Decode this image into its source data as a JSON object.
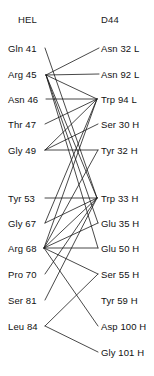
{
  "diagram": {
    "type": "bipartite-contact-map",
    "line_color": "#1b1b1b",
    "background_color": "#ffffff",
    "text_color": "#111111"
  },
  "columns": {
    "left": {
      "header": "HEL",
      "header_x": 18,
      "header_y": 14
    },
    "right": {
      "header": "D44",
      "header_x": 101,
      "header_y": 14
    }
  },
  "left_nodes": [
    {
      "id": "L0",
      "label": "Gln 41",
      "residue": "Gln",
      "number": 41,
      "x": 8,
      "y": 48,
      "anchor_x": 45,
      "anchor_y": 48
    },
    {
      "id": "L1",
      "label": "Arg 45",
      "residue": "Arg",
      "number": 45,
      "x": 8,
      "y": 74,
      "anchor_x": 46,
      "anchor_y": 75
    },
    {
      "id": "L2",
      "label": "Asn 46",
      "residue": "Asn",
      "number": 46,
      "x": 8,
      "y": 99,
      "anchor_x": 46,
      "anchor_y": 99
    },
    {
      "id": "L3",
      "label": "Thr 47",
      "residue": "Thr",
      "number": 47,
      "x": 8,
      "y": 124,
      "anchor_x": 45,
      "anchor_y": 124
    },
    {
      "id": "L4",
      "label": "Gly 49",
      "residue": "Gly",
      "number": 49,
      "x": 8,
      "y": 150,
      "anchor_x": 45,
      "anchor_y": 150
    },
    {
      "id": "L5",
      "label": "Tyr 53",
      "residue": "Tyr",
      "number": 53,
      "x": 8,
      "y": 198,
      "anchor_x": 45,
      "anchor_y": 198
    },
    {
      "id": "L6",
      "label": "Gly 67",
      "residue": "Gly",
      "number": 67,
      "x": 8,
      "y": 223,
      "anchor_x": 45,
      "anchor_y": 223
    },
    {
      "id": "L7",
      "label": "Arg 68",
      "residue": "Arg",
      "number": 68,
      "x": 8,
      "y": 248,
      "anchor_x": 44,
      "anchor_y": 248
    },
    {
      "id": "L8",
      "label": "Pro 70",
      "residue": "Pro",
      "number": 70,
      "x": 8,
      "y": 274,
      "anchor_x": 45,
      "anchor_y": 274
    },
    {
      "id": "L9",
      "label": "Ser 81",
      "residue": "Ser",
      "number": 81,
      "x": 8,
      "y": 300,
      "anchor_x": 45,
      "anchor_y": 300
    },
    {
      "id": "L10",
      "label": "Leu 84",
      "residue": "Leu",
      "number": 84,
      "x": 8,
      "y": 326,
      "anchor_x": 45,
      "anchor_y": 326
    }
  ],
  "right_nodes": [
    {
      "id": "R0",
      "label": "Asn 32 L",
      "residue": "Asn",
      "number": 32,
      "chain": "L",
      "x": 101,
      "y": 48,
      "anchor_x": 99,
      "anchor_y": 48
    },
    {
      "id": "R1",
      "label": "Asn 92 L",
      "residue": "Asn",
      "number": 92,
      "chain": "L",
      "x": 101,
      "y": 74,
      "anchor_x": 99,
      "anchor_y": 74
    },
    {
      "id": "R2",
      "label": "Trp 94 L",
      "residue": "Trp",
      "number": 94,
      "chain": "L",
      "x": 101,
      "y": 99,
      "anchor_x": 97,
      "anchor_y": 99
    },
    {
      "id": "R3",
      "label": "Ser 30 H",
      "residue": "Ser",
      "number": 30,
      "chain": "H",
      "x": 101,
      "y": 124,
      "anchor_x": 98,
      "anchor_y": 124
    },
    {
      "id": "R4",
      "label": "Tyr 32 H",
      "residue": "Tyr",
      "number": 32,
      "chain": "H",
      "x": 101,
      "y": 150,
      "anchor_x": 98,
      "anchor_y": 150
    },
    {
      "id": "R5",
      "label": "Trp 33 H",
      "residue": "Trp",
      "number": 33,
      "chain": "H",
      "x": 101,
      "y": 198,
      "anchor_x": 97,
      "anchor_y": 198
    },
    {
      "id": "R6",
      "label": "Glu 35 H",
      "residue": "Glu",
      "number": 35,
      "chain": "H",
      "x": 101,
      "y": 223,
      "anchor_x": 98,
      "anchor_y": 223
    },
    {
      "id": "R7",
      "label": "Glu 50 H",
      "residue": "Glu",
      "number": 50,
      "chain": "H",
      "x": 101,
      "y": 248,
      "anchor_x": 98,
      "anchor_y": 248
    },
    {
      "id": "R8",
      "label": "Ser 55 H",
      "residue": "Ser",
      "number": 55,
      "chain": "H",
      "x": 101,
      "y": 274,
      "anchor_x": 98,
      "anchor_y": 274
    },
    {
      "id": "R9",
      "label": "Tyr 59 H",
      "residue": "Tyr",
      "number": 59,
      "chain": "H",
      "x": 101,
      "y": 300,
      "anchor_x": 98,
      "anchor_y": 300
    },
    {
      "id": "R10",
      "label": "Asp 100 H",
      "residue": "Asp",
      "number": 100,
      "chain": "H",
      "x": 101,
      "y": 326,
      "anchor_x": 98,
      "anchor_y": 326
    },
    {
      "id": "R11",
      "label": "Gly 101 H",
      "residue": "Gly",
      "number": 101,
      "chain": "H",
      "x": 101,
      "y": 352,
      "anchor_x": 98,
      "anchor_y": 352
    }
  ],
  "edges": [
    {
      "from": "L0",
      "to": "R5"
    },
    {
      "from": "L1",
      "to": "R0"
    },
    {
      "from": "L1",
      "to": "R1"
    },
    {
      "from": "L1",
      "to": "R2"
    },
    {
      "from": "L1",
      "to": "R5"
    },
    {
      "from": "L1",
      "to": "R6"
    },
    {
      "from": "L1",
      "to": "R7"
    },
    {
      "from": "L2",
      "to": "R2"
    },
    {
      "from": "L3",
      "to": "R2"
    },
    {
      "from": "L4",
      "to": "R2"
    },
    {
      "from": "L4",
      "to": "R3"
    },
    {
      "from": "L4",
      "to": "R4"
    },
    {
      "from": "L5",
      "to": "R5"
    },
    {
      "from": "L6",
      "to": "R2"
    },
    {
      "from": "L6",
      "to": "R5"
    },
    {
      "from": "L7",
      "to": "R2"
    },
    {
      "from": "L7",
      "to": "R4"
    },
    {
      "from": "L7",
      "to": "R5"
    },
    {
      "from": "L7",
      "to": "R6"
    },
    {
      "from": "L7",
      "to": "R7"
    },
    {
      "from": "L7",
      "to": "R8"
    },
    {
      "from": "L7",
      "to": "R10"
    },
    {
      "from": "L8",
      "to": "R5"
    },
    {
      "from": "L9",
      "to": "R5"
    },
    {
      "from": "L10",
      "to": "R8"
    },
    {
      "from": "L10",
      "to": "R11"
    }
  ]
}
